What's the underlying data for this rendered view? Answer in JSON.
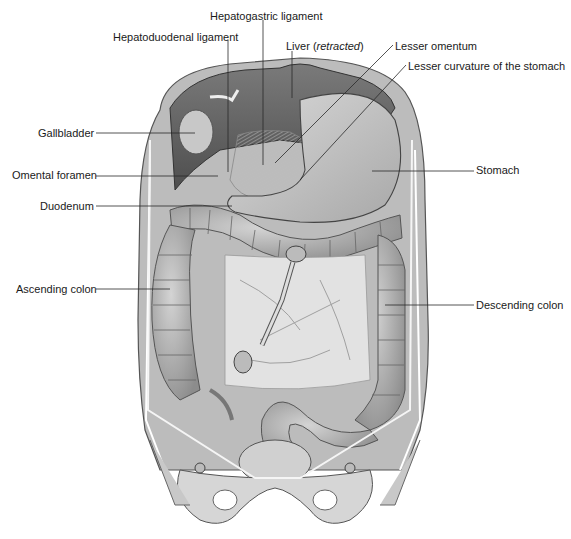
{
  "figure": {
    "labels": [
      {
        "id": "hepatogastric-ligament",
        "text": "Hepatogastric ligament",
        "x": 210,
        "y": 10
      },
      {
        "id": "hepatoduodenal-ligament",
        "text": "Hepatoduodenal ligament",
        "x": 113,
        "y": 31
      },
      {
        "id": "liver",
        "text": "Liver (",
        "italic": "retracted",
        "suffix": ")",
        "x": 286,
        "y": 40
      },
      {
        "id": "lesser-omentum",
        "text": "Lesser omentum",
        "x": 395,
        "y": 40
      },
      {
        "id": "lesser-curvature",
        "text": "Lesser curvature of the stomach",
        "x": 408,
        "y": 60
      },
      {
        "id": "gallbladder",
        "text": "Gallbladder",
        "x": 38,
        "y": 127
      },
      {
        "id": "omental-foramen",
        "text": "Omental foramen",
        "x": 12,
        "y": 169
      },
      {
        "id": "stomach",
        "text": "Stomach",
        "x": 476,
        "y": 164
      },
      {
        "id": "duodenum",
        "text": "Duodenum",
        "x": 40,
        "y": 200
      },
      {
        "id": "ascending-colon",
        "text": "Ascending colon",
        "x": 16,
        "y": 283
      },
      {
        "id": "descending-colon",
        "text": "Descending colon",
        "x": 476,
        "y": 299
      }
    ],
    "colors": {
      "background": "#ffffff",
      "label_text": "#1a1a1a",
      "leader_line": "#2a2a2a",
      "tissue_dark": "#5a5a5a",
      "tissue_mid": "#9a9a9a",
      "tissue_light": "#cfcfcf",
      "tissue_pale": "#e6e6e6"
    }
  }
}
